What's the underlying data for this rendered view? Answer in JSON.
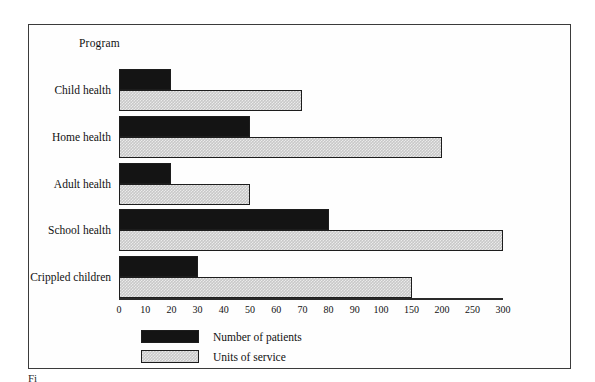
{
  "chart_data": {
    "type": "bar",
    "orientation": "horizontal",
    "title": "",
    "xlabel": "",
    "ylabel": "Program",
    "categories": [
      "Child health",
      "Home health",
      "Adult health",
      "School health",
      "Crippled children"
    ],
    "series": [
      {
        "name": "Number of patients",
        "color": "#141414",
        "values": [
          20,
          50,
          20,
          80,
          30
        ]
      },
      {
        "name": "Units of service",
        "color": "#c8c8c8",
        "values": [
          70,
          200,
          50,
          300,
          150
        ]
      }
    ],
    "xticks": [
      0,
      10,
      20,
      30,
      40,
      50,
      60,
      70,
      80,
      90,
      100,
      150,
      200,
      250,
      300
    ],
    "xtick_labels": [
      "0",
      "10",
      "20",
      "30",
      "40",
      "50",
      "60",
      "70",
      "80",
      "90",
      "100",
      "150",
      "200",
      "250",
      "300"
    ],
    "xlim": [
      0,
      300
    ],
    "axis_note": "broken / non-linear x axis: 0-100 in steps of 10, then 100-300 in steps of 50",
    "grid": false,
    "legend_position": "bottom-left"
  },
  "axis": {
    "program_label": "Program"
  },
  "legend": {
    "items": [
      {
        "label": "Number of patients",
        "swatch": "dark"
      },
      {
        "label": "Units of service",
        "swatch": "hatch"
      }
    ]
  },
  "caption": {
    "text": "Fi"
  }
}
